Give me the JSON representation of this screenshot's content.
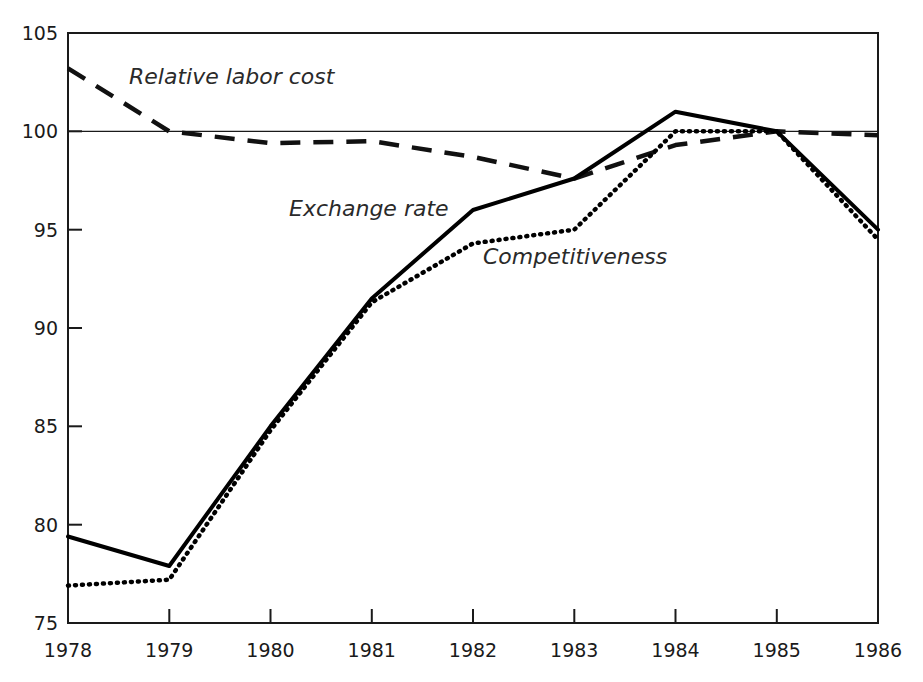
{
  "chart_data": {
    "type": "line",
    "title": "",
    "subtitle": "",
    "xlabel": "",
    "ylabel": "",
    "x": [
      1978,
      1979,
      1980,
      1981,
      1982,
      1983,
      1984,
      1985,
      1986
    ],
    "categories": [
      "1978",
      "1979",
      "1980",
      "1981",
      "1982",
      "1983",
      "1984",
      "1985",
      "1986"
    ],
    "xlim": [
      1978,
      1986
    ],
    "ylim": [
      75,
      105
    ],
    "yticks": [
      75,
      80,
      85,
      90,
      95,
      100,
      105
    ],
    "ytick_labels": [
      "75",
      "80",
      "85",
      "90",
      "95",
      "100",
      "105"
    ],
    "xticks": [
      1978,
      1979,
      1980,
      1981,
      1982,
      1983,
      1984,
      1985,
      1986
    ],
    "xtick_labels": [
      "1978",
      "1979",
      "1980",
      "1981",
      "1982",
      "1983",
      "1984",
      "1985",
      "1986"
    ],
    "grid": false,
    "reference_line": {
      "value": 100,
      "style": "solid-thin",
      "color": "#1a1a1a"
    },
    "legend_position": "inline-annotations",
    "series": [
      {
        "name": "Relative labor cost",
        "style": "dashed",
        "color": "#111111",
        "values": [
          103.2,
          100.0,
          99.4,
          99.5,
          98.7,
          97.6,
          99.3,
          100.0,
          99.8
        ],
        "annotation": {
          "text": "Relative labor cost",
          "x": 129,
          "y": 84
        }
      },
      {
        "name": "Exchange rate",
        "style": "solid",
        "color": "#000000",
        "values": [
          79.4,
          77.9,
          85.0,
          91.5,
          96.0,
          97.6,
          101.0,
          100.0,
          95.0
        ],
        "annotation": {
          "text": "Exchange rate",
          "x": 289,
          "y": 216
        }
      },
      {
        "name": "Competitiveness",
        "style": "dotted",
        "color": "#000000",
        "values": [
          76.9,
          77.2,
          84.8,
          91.3,
          94.3,
          95.0,
          100.0,
          100.0,
          94.5
        ],
        "annotation": {
          "text": "Competitiveness",
          "x": 483,
          "y": 264
        }
      }
    ]
  },
  "plot": {
    "frame_color": "#1a1a1a",
    "background": "#ffffff",
    "left": 68,
    "right": 878,
    "top": 33,
    "bottom": 623
  }
}
